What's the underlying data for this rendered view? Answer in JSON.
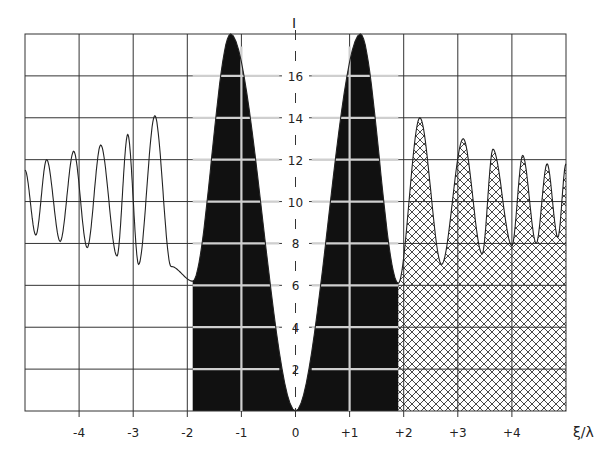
{
  "chart_data": {
    "type": "line",
    "title": "",
    "xlabel": "ξ/λ",
    "ylabel": "I",
    "xlim": [
      -5,
      5
    ],
    "ylim": [
      0,
      18
    ],
    "grid": true,
    "x_ticks": [
      "-4",
      "-3",
      "-2",
      "-1",
      "0",
      "+1",
      "+2",
      "+3",
      "+4"
    ],
    "x_tick_values": [
      -4,
      -3,
      -2,
      -1,
      0,
      1,
      2,
      3,
      4
    ],
    "y_ticks": [
      "2",
      "4",
      "6",
      "8",
      "10",
      "12",
      "14",
      "16"
    ],
    "y_tick_values": [
      2,
      4,
      6,
      8,
      10,
      12,
      14,
      16
    ],
    "series": [
      {
        "name": "intensity",
        "x": [
          -5.0,
          -4.8,
          -4.6,
          -4.35,
          -4.1,
          -3.85,
          -3.6,
          -3.3,
          -3.1,
          -2.9,
          -2.6,
          -2.3,
          -1.9,
          -1.2,
          0.0,
          1.2,
          1.9,
          2.3,
          2.7,
          3.1,
          3.45,
          3.65,
          4.0,
          4.2,
          4.45,
          4.65,
          4.85,
          5.0
        ],
        "y": [
          11.5,
          8.4,
          12.0,
          8.1,
          12.4,
          7.8,
          12.7,
          7.4,
          13.2,
          7.0,
          14.1,
          6.9,
          6.2,
          18.0,
          0.0,
          18.0,
          6.1,
          14.0,
          7.0,
          13.0,
          7.5,
          12.5,
          7.9,
          12.2,
          8.0,
          11.8,
          8.3,
          11.8
        ]
      }
    ],
    "regions": [
      {
        "name": "central-region",
        "x_range": [
          -1.9,
          1.9
        ],
        "fill": "solid-black"
      },
      {
        "name": "right-region",
        "x_range": [
          1.9,
          5.0
        ],
        "fill": "crosshatch"
      }
    ],
    "colors": {
      "ink": "#1a1a1a",
      "paper": "#ffffff",
      "grid": "#333333"
    }
  }
}
